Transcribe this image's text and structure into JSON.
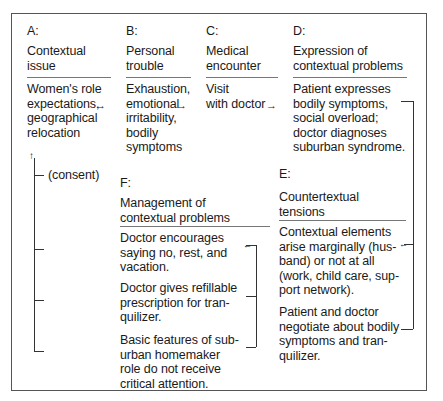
{
  "diagram": {
    "sections": {
      "A": {
        "letter": "A:",
        "title": "Contextual\nissue",
        "body": "Women's role\nexpectations,\ngeographical\nrelocation"
      },
      "B": {
        "letter": "B:",
        "title": "Personal\ntrouble",
        "body": "Exhaustion,\nemotional\nirritability,\nbodily\nsymptoms"
      },
      "C": {
        "letter": "C:",
        "title": "Medical\nencounter",
        "body": "Visit\nwith doctor"
      },
      "D": {
        "letter": "D:",
        "title": "Expression of\ncontextual problems",
        "body": "Patient expresses\nbodily symptoms,\nsocial overload;\ndoctor diagnoses\nsuburban syndrome."
      },
      "E": {
        "letter": "E:",
        "title": "Countertextual\ntensions",
        "items": [
          "Contextual elements\narise marginally (hus-\nband) or not at all\n(work, child care, sup-\nport network).",
          "Patient and doctor\nnegotiate about bodily\nsymptoms and tran-\nquilizer."
        ]
      },
      "F": {
        "letter": "F:",
        "title": "Management of\ncontextual problems",
        "items": [
          "Doctor encourages\nsaying no, rest, and\nvacation.",
          "Doctor gives refillable\nprescription for tran-\nquilizer.",
          "Basic features of sub-\nurban homemaker\nrole do not receive\ncritical attention."
        ]
      }
    },
    "connectors": {
      "feedback_label": "(consent)",
      "arrow_right": "→",
      "arrow_left": "←",
      "arrow_up": "↑"
    }
  }
}
